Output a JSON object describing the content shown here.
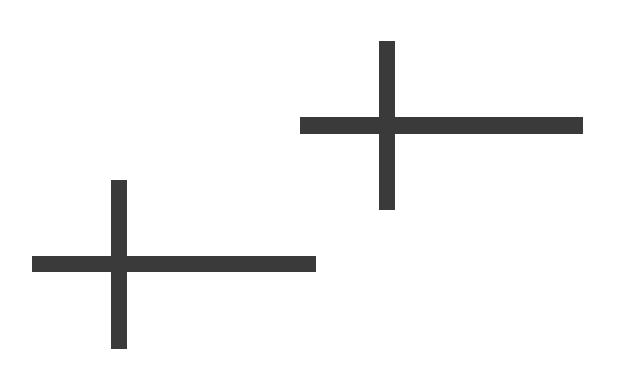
{
  "canvas": {
    "width": 617,
    "height": 365,
    "background_color": "#ffffff",
    "shape_color": "#3a3a3a"
  },
  "figure": {
    "shape_count": 2,
    "shape_kind": "plus-sign-cross"
  },
  "shapes": [
    {
      "id": "cross-upper-right",
      "label": "Upper right cross",
      "color": "#3a3a3a",
      "center_x": 387,
      "center_y": 125,
      "horizontal_bar": {
        "x": 300,
        "y": 117,
        "width": 283,
        "height": 17
      },
      "vertical_bar": {
        "x": 379,
        "y": 41,
        "width": 16,
        "height": 169
      }
    },
    {
      "id": "cross-lower-left",
      "label": "Lower left cross",
      "color": "#3a3a3a",
      "center_x": 119,
      "center_y": 264,
      "horizontal_bar": {
        "x": 32,
        "y": 256,
        "width": 284,
        "height": 16
      },
      "vertical_bar": {
        "x": 111,
        "y": 180,
        "width": 16,
        "height": 169
      }
    }
  ]
}
